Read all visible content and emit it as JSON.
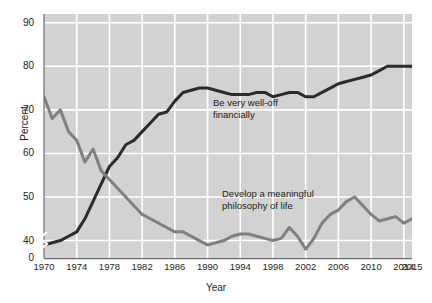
{
  "chart_data": {
    "type": "line",
    "title": "",
    "xlabel": "Year",
    "ylabel": "Percent",
    "xlim": [
      1970,
      2015
    ],
    "ylim": [
      36,
      92
    ],
    "grid": true,
    "axis_break": {
      "present": true,
      "between": [
        0,
        40
      ]
    },
    "legend_position": "inline-annotations",
    "background_color": "#d2d2d2",
    "gridline_color": "#ffffff",
    "y_ticks": [
      "0",
      "40",
      "50",
      "60",
      "70",
      "80",
      "90"
    ],
    "y_tick_values": [
      36,
      40,
      50,
      60,
      70,
      80,
      90
    ],
    "x_ticks": [
      "1970",
      "1974",
      "1978",
      "1982",
      "1986",
      "1990",
      "1994",
      "1998",
      "2002",
      "2006",
      "2010",
      "2014",
      "2015"
    ],
    "x_tick_values": [
      1970,
      1974,
      1978,
      1982,
      1986,
      1990,
      1994,
      1998,
      2002,
      2006,
      2010,
      2014,
      2015
    ],
    "series": [
      {
        "name": "Be very well-off financially",
        "color": "#2b2b2b",
        "label_text": "Be very well-off\nfinancially",
        "x": [
          1970,
          1971,
          1972,
          1973,
          1974,
          1975,
          1976,
          1977,
          1978,
          1979,
          1980,
          1981,
          1982,
          1983,
          1984,
          1985,
          1986,
          1987,
          1988,
          1989,
          1990,
          1991,
          1992,
          1993,
          1994,
          1995,
          1996,
          1997,
          1998,
          1999,
          2000,
          2001,
          2002,
          2003,
          2004,
          2005,
          2006,
          2007,
          2008,
          2009,
          2010,
          2011,
          2012,
          2013,
          2014,
          2015
        ],
        "y": [
          39,
          39.5,
          40,
          41,
          42,
          45,
          49,
          53,
          57,
          59,
          62,
          63,
          65,
          67,
          69,
          69.5,
          72,
          74,
          74.5,
          75,
          75,
          74.5,
          74,
          73.5,
          73.5,
          73.5,
          74,
          74,
          73,
          73.5,
          74,
          74,
          73,
          73,
          74,
          75,
          76,
          76.5,
          77,
          77.5,
          78,
          79,
          80,
          80,
          80,
          80
        ]
      },
      {
        "name": "Develop a meaningful philosophy of life",
        "color": "#808080",
        "label_text": "Develop a meaningful\nphilosophy of life",
        "x": [
          1970,
          1971,
          1972,
          1973,
          1974,
          1975,
          1976,
          1977,
          1978,
          1979,
          1980,
          1981,
          1982,
          1983,
          1984,
          1985,
          1986,
          1987,
          1988,
          1989,
          1990,
          1991,
          1992,
          1993,
          1994,
          1995,
          1996,
          1997,
          1998,
          1999,
          2000,
          2001,
          2002,
          2003,
          2004,
          2005,
          2006,
          2007,
          2008,
          2009,
          2010,
          2011,
          2012,
          2013,
          2014,
          2015
        ],
        "y": [
          73,
          68,
          70,
          65,
          63,
          58,
          61,
          56,
          54,
          52,
          50,
          48,
          46,
          45,
          44,
          43,
          42,
          42,
          41,
          40,
          39,
          39.5,
          40,
          41,
          41.5,
          41.5,
          41,
          40.5,
          40,
          40.5,
          43,
          41,
          38,
          40.5,
          44,
          46,
          47,
          49,
          50,
          48,
          46,
          44.5,
          45,
          45.5,
          44,
          45
        ]
      }
    ]
  }
}
